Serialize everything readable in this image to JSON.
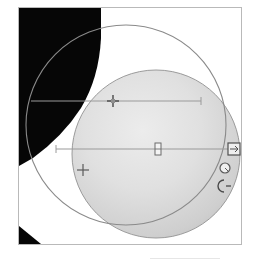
{
  "app": {
    "title": "Shape Canvas",
    "canvas_label": "drawing-canvas"
  },
  "canvas": {
    "width": 222,
    "height": 236,
    "background_color": "#ffffff",
    "border_color": "#b9b9b9"
  },
  "colors": {
    "black_fill": "#060606",
    "gray_circle_light": "#e3e3e3",
    "gray_circle_dark": "#c2c2c2",
    "outline_stroke": "#8a8a8a",
    "guide_line": "#9a9a9a",
    "handle_stroke": "#555555",
    "handle_fill": "#f2f2f2",
    "frame_border": "#b9b9b9"
  },
  "shapes": [
    {
      "name": "black-region",
      "type": "polygon-silhouette",
      "fill": "#060606",
      "description": "large black wedge occupying upper-left of canvas"
    },
    {
      "name": "corner-black-triangle",
      "type": "triangle",
      "fill": "#060606",
      "description": "small black triangle at lower-left corner of canvas"
    },
    {
      "name": "outline-circle",
      "type": "circle",
      "cx": 107,
      "cy": 117,
      "r": 100,
      "fill": "none",
      "stroke": "#8a8a8a",
      "stroke_width": 1
    },
    {
      "name": "gray-filled-circle",
      "type": "circle",
      "cx": 137,
      "cy": 146,
      "r": 84,
      "fill": "gradient",
      "stroke": "#8a8a8a",
      "stroke_width": 1
    }
  ],
  "guides": [
    {
      "name": "upper-guide-line",
      "type": "horizontal",
      "x1": 12,
      "x2": 182,
      "y": 93,
      "stroke": "#9a9a9a"
    },
    {
      "name": "lower-guide-line",
      "type": "horizontal",
      "x1": 37,
      "x2": 216,
      "y": 141,
      "stroke": "#9a9a9a"
    }
  ],
  "handles": [
    {
      "name": "crosshair-handle-upper",
      "glyph": "plus",
      "x": 94,
      "y": 93
    },
    {
      "name": "crosshair-handle-lower-left",
      "glyph": "plus",
      "x": 64,
      "y": 162
    },
    {
      "name": "center-node-handle",
      "glyph": "node",
      "x": 139,
      "y": 141
    },
    {
      "name": "square-anchor-handle",
      "glyph": "square",
      "x": 215,
      "y": 141
    },
    {
      "name": "circle-anchor-handle",
      "glyph": "circle",
      "x": 212,
      "y": 160
    },
    {
      "name": "open-arc-handle",
      "glyph": "arc",
      "x": 208,
      "y": 177
    }
  ]
}
